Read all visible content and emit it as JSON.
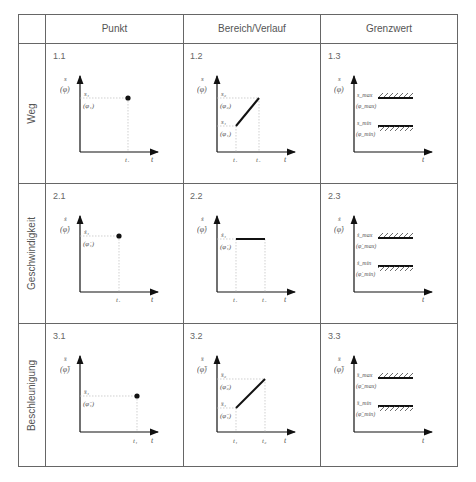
{
  "table": {
    "columns": [
      {
        "label": "Punkt"
      },
      {
        "label": "Bereich/Verlauf"
      },
      {
        "label": "Grenzwert"
      }
    ],
    "rows": [
      {
        "label": "Weg"
      },
      {
        "label": "Geschwindigkeit"
      },
      {
        "label": "Beschleunigung"
      }
    ],
    "cells": [
      [
        "1.1",
        "1.2",
        "1.3"
      ],
      [
        "2.1",
        "2.2",
        "2.3"
      ],
      [
        "3.1",
        "3.2",
        "3.3"
      ]
    ]
  },
  "diagrams": {
    "row1": {
      "y_axis": "s",
      "y_axis_alt": "(φ)",
      "p1": "s₁",
      "p1_alt": "(φ₁)",
      "p2": "s₂",
      "p2_alt": "(φ₂)",
      "max": "s_max",
      "max_alt": "(φ_max)",
      "min": "s_min",
      "min_alt": "(φ_min)"
    },
    "row2": {
      "y_axis": "ṡ",
      "y_axis_alt": "(φ̇)",
      "p1": "ṡ₁",
      "p1_alt": "(φ̇₁)",
      "max": "ṡ_max",
      "max_alt": "(φ̇_max)",
      "min": "ṡ_min",
      "min_alt": "(φ̇_min)"
    },
    "row3": {
      "y_axis": "s̈",
      "y_axis_alt": "(φ̈)",
      "p1": "s̈₁",
      "p1_alt": "(φ̈₁)",
      "p2": "s̈₂",
      "p2_alt": "(φ̈₂)",
      "max": "s̈_max",
      "max_alt": "(φ̈_max)",
      "min": "s̈_min",
      "min_alt": "(φ̈_min)"
    },
    "x_axis": "t",
    "t1": "t₁",
    "t2": "t₂"
  },
  "colors": {
    "grid": "#555555",
    "guide": "#bbbbbb",
    "ink": "#111111"
  }
}
